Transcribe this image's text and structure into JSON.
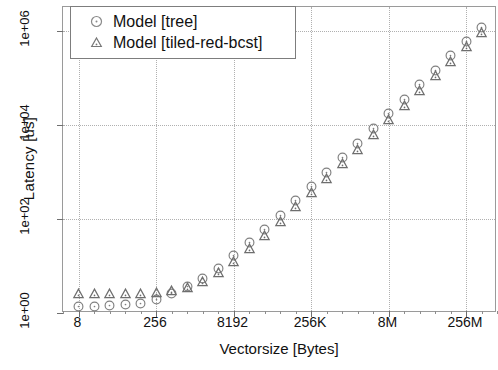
{
  "chart_data": {
    "type": "scatter",
    "title": "",
    "xlabel": "Vectorsize [Bytes]",
    "ylabel": "Latency [us]",
    "xscale": "log2",
    "yscale": "log10",
    "grid": true,
    "legend_position": "top-left",
    "xlim": [
      4,
      1073741824
    ],
    "ylim": [
      1,
      3162277.0
    ],
    "xticks": [
      {
        "label": "8",
        "value": 8
      },
      {
        "label": "256",
        "value": 256
      },
      {
        "label": "8192",
        "value": 8192
      },
      {
        "label": "256K",
        "value": 262144
      },
      {
        "label": "8M",
        "value": 8388608
      },
      {
        "label": "256M",
        "value": 268435456
      }
    ],
    "yticks": [
      {
        "label": "1e+00",
        "value": 1
      },
      {
        "label": "1e+02",
        "value": 100
      },
      {
        "label": "1e+04",
        "value": 10000
      },
      {
        "label": "1e+06",
        "value": 1000000
      }
    ],
    "x": [
      8,
      16,
      32,
      64,
      128,
      256,
      512,
      1024,
      2048,
      4096,
      8192,
      16384,
      32768,
      65536,
      131072,
      262144,
      524288,
      1048576,
      2097152,
      4194304,
      8388608,
      16777216,
      33554432,
      67108864,
      134217728,
      268435456,
      536870912
    ],
    "series": [
      {
        "name": "Model [tree]",
        "marker": "circle",
        "color": "#808080",
        "values": [
          1.35,
          1.38,
          1.42,
          1.48,
          1.6,
          1.95,
          2.6,
          3.6,
          5.4,
          9.0,
          16.5,
          31.0,
          60.0,
          120.0,
          240.0,
          480.0,
          980.0,
          2000.0,
          4000.0,
          8200.0,
          17000.0,
          34000.0,
          70000.0,
          143000.0,
          290000.0,
          590000.0,
          1150000.0
        ]
      },
      {
        "name": "Model [tiled-red-bcst]",
        "marker": "triangle",
        "color": "#6e6e6e",
        "values": [
          2.6,
          2.6,
          2.6,
          2.6,
          2.62,
          2.7,
          2.95,
          3.5,
          4.6,
          7.2,
          12.5,
          23.0,
          45.0,
          90.0,
          180.0,
          360.0,
          730.0,
          1500.0,
          3000.0,
          6200.0,
          13000.0,
          26000.0,
          53000.0,
          110000.0,
          225000.0,
          460000.0,
          900000.0
        ]
      }
    ]
  },
  "legend": {
    "entries": [
      {
        "label": "Model [tree]",
        "symbol": "circle-icon"
      },
      {
        "label": "Model [tiled-red-bcst]",
        "symbol": "triangle-icon"
      }
    ]
  }
}
